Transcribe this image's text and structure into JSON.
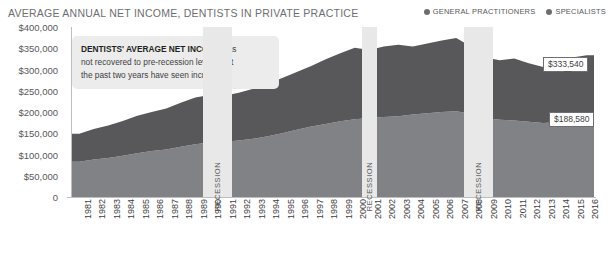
{
  "header": {
    "title": "AVERAGE ANNUAL NET INCOME, DENTISTS IN PRIVATE PRACTICE"
  },
  "legend": {
    "items": [
      {
        "label": "GENERAL PRACTITIONERS",
        "color": "#6d6e71"
      },
      {
        "label": "SPECIALISTS",
        "color": "#6d6e71"
      }
    ]
  },
  "annotation": {
    "bold": "DENTISTS' AVERAGE NET INCOME",
    "rest_line1": " has",
    "line2": "not recovered to pre-recession levels, but",
    "line3": "the past two years have seen increases."
  },
  "callouts": [
    {
      "name": "specialists-callout",
      "value": "$333,540"
    },
    {
      "name": "gp-callout",
      "value": "$188,580"
    }
  ],
  "recessions": [
    {
      "label": "RECESSION",
      "start": 1990,
      "end": 1991
    },
    {
      "label": "RECESSION",
      "start": 2001,
      "end": 2001
    },
    {
      "label": "RECESSION",
      "start": 2008,
      "end": 2009
    }
  ],
  "caption": "",
  "chart_data": {
    "type": "area",
    "title": "AVERAGE ANNUAL NET INCOME, DENTISTS IN PRIVATE PRACTICE",
    "xlabel": "",
    "ylabel": "",
    "ylim": [
      0,
      400000
    ],
    "ytick_labels": [
      "$400,000",
      "$350,000",
      "$300,000",
      "$250,000",
      "$200,000",
      "$150,000",
      "$100,000",
      "$50,000",
      "0"
    ],
    "ytick_values": [
      400000,
      350000,
      300000,
      250000,
      200000,
      150000,
      100000,
      50000,
      0
    ],
    "grid": false,
    "legend_position": "top-right",
    "stacked": true,
    "categories": [
      "1981",
      "1982",
      "1983",
      "1984",
      "1985",
      "1986",
      "1987",
      "1988",
      "1989",
      "1990",
      "1991",
      "1992",
      "1993",
      "1994",
      "1995",
      "1996",
      "1997",
      "1998",
      "1999",
      "2000",
      "2001",
      "2002",
      "2003",
      "2004",
      "2005",
      "2006",
      "2007",
      "2008",
      "2009",
      "2010",
      "2011",
      "2012",
      "2013",
      "2014",
      "2015",
      "2016"
    ],
    "series": [
      {
        "name": "GENERAL PRACTITIONERS",
        "color": "#808285",
        "values": [
          83000,
          88000,
          92000,
          97000,
          103000,
          108000,
          112000,
          118000,
          124000,
          128000,
          130000,
          133000,
          137000,
          143000,
          150000,
          158000,
          166000,
          172000,
          178000,
          183000,
          186000,
          188000,
          190000,
          194000,
          197000,
          200000,
          202000,
          196000,
          186000,
          182000,
          180000,
          177000,
          174000,
          176000,
          183000,
          188580
        ]
      },
      {
        "name": "SPECIALISTS",
        "color": "#58585b",
        "values": [
          66000,
          72000,
          76000,
          82000,
          88000,
          92000,
          96000,
          104000,
          110000,
          112000,
          108000,
          112000,
          118000,
          124000,
          130000,
          136000,
          142000,
          152000,
          160000,
          168000,
          160000,
          166000,
          168000,
          160000,
          164000,
          168000,
          172000,
          158000,
          142000,
          140000,
          146000,
          138000,
          132000,
          136000,
          145000,
          144960
        ]
      }
    ],
    "totals": [
      149000,
      160000,
      168000,
      179000,
      191000,
      200000,
      208000,
      222000,
      234000,
      240000,
      238000,
      245000,
      255000,
      267000,
      280000,
      294000,
      308000,
      324000,
      338000,
      351000,
      346000,
      354000,
      358000,
      354000,
      361000,
      368000,
      374000,
      354000,
      328000,
      322000,
      326000,
      315000,
      306000,
      312000,
      328000,
      333540
    ]
  }
}
